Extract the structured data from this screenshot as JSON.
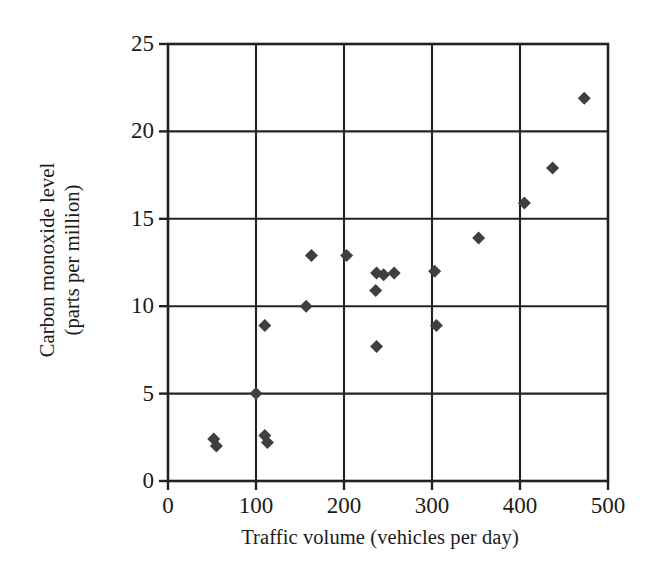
{
  "chart_data": {
    "type": "scatter",
    "title": "",
    "xlabel": "Traffic volume (vehicles per day)",
    "ylabel_line1": "Carbon monoxide level",
    "ylabel_line2": "(parts per million)",
    "ylabel": "Carbon monoxide level (parts per million)",
    "xlim": [
      0,
      500
    ],
    "ylim": [
      0,
      25
    ],
    "xticks": [
      0,
      100,
      200,
      300,
      400,
      500
    ],
    "yticks": [
      0,
      5,
      10,
      15,
      20,
      25
    ],
    "xtick_labels": [
      "0",
      "100",
      "200",
      "300",
      "400",
      "500"
    ],
    "ytick_labels": [
      "0",
      "5",
      "10",
      "15",
      "20",
      "25"
    ],
    "grid": true,
    "grid_color": "#222222",
    "legend": false,
    "marker": "diamond",
    "marker_color": "#3f3f3f",
    "marker_size": 13,
    "points": [
      {
        "x": 52,
        "y": 2.4
      },
      {
        "x": 55,
        "y": 2.0
      },
      {
        "x": 100,
        "y": 5.0
      },
      {
        "x": 110,
        "y": 2.6
      },
      {
        "x": 113,
        "y": 2.2
      },
      {
        "x": 110,
        "y": 8.9
      },
      {
        "x": 157,
        "y": 10.0
      },
      {
        "x": 163,
        "y": 12.9
      },
      {
        "x": 203,
        "y": 12.9
      },
      {
        "x": 236,
        "y": 10.9
      },
      {
        "x": 237,
        "y": 11.9
      },
      {
        "x": 245,
        "y": 11.8
      },
      {
        "x": 257,
        "y": 11.9
      },
      {
        "x": 237,
        "y": 7.7
      },
      {
        "x": 303,
        "y": 12.0
      },
      {
        "x": 305,
        "y": 8.9
      },
      {
        "x": 353,
        "y": 13.9
      },
      {
        "x": 405,
        "y": 15.9
      },
      {
        "x": 437,
        "y": 17.9
      },
      {
        "x": 473,
        "y": 21.9
      }
    ]
  },
  "axes": {
    "plot_left_px": 168,
    "plot_top_px": 44,
    "plot_width_px": 440,
    "plot_height_px": 437
  }
}
